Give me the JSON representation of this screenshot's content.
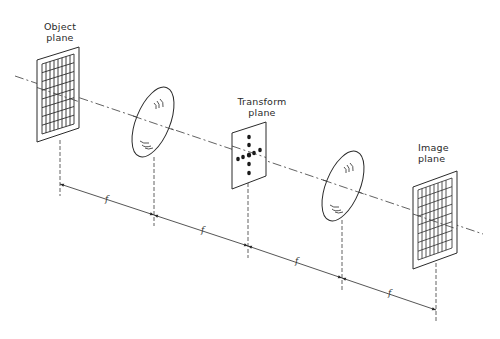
{
  "diagram": {
    "labels": {
      "object_plane": [
        "Object",
        "plane"
      ],
      "transform_plane": [
        "Transform",
        "plane"
      ],
      "image_plane": [
        "Image",
        "plane"
      ]
    },
    "focal_label": "f",
    "segments": [
      {
        "from": "object-plane",
        "to": "lens-1",
        "label": "f"
      },
      {
        "from": "lens-1",
        "to": "transform-plane",
        "label": "f"
      },
      {
        "from": "transform-plane",
        "to": "lens-2",
        "label": "f"
      },
      {
        "from": "lens-2",
        "to": "image-plane",
        "label": "f"
      }
    ],
    "elements": [
      "object-plane",
      "lens-1",
      "transform-plane",
      "lens-2",
      "image-plane"
    ],
    "colors": {
      "line": "#2a2a2a",
      "background": "#ffffff"
    }
  }
}
